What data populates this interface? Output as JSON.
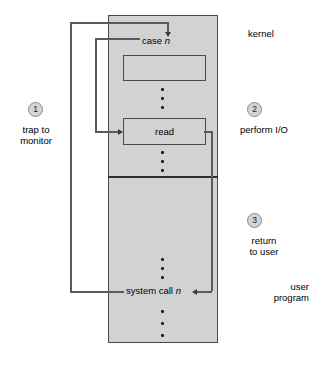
{
  "diagram": {
    "regions": {
      "kernel_label": "kernel",
      "user_label_line1": "user",
      "user_label_line2": "program"
    },
    "boxes": {
      "case_label": "case",
      "case_variable": "n",
      "empty_box_label": "",
      "read_label": "read",
      "syscall_label": "system call",
      "syscall_variable": "n"
    },
    "steps": [
      {
        "number": "1",
        "line1": "trap to",
        "line2": "monitor"
      },
      {
        "number": "2",
        "line1": "perform I/O",
        "line2": ""
      },
      {
        "number": "3",
        "line1": "return",
        "line2": "to user"
      }
    ],
    "colors": {
      "box_fill": "#d2d2d2",
      "box_stroke": "#4a4a4a",
      "line": "#5a5a5a",
      "arrow": "#3a3a3a",
      "text": "#000000",
      "circle_fill": "#d4d4d4",
      "background": "#ffffff"
    }
  }
}
